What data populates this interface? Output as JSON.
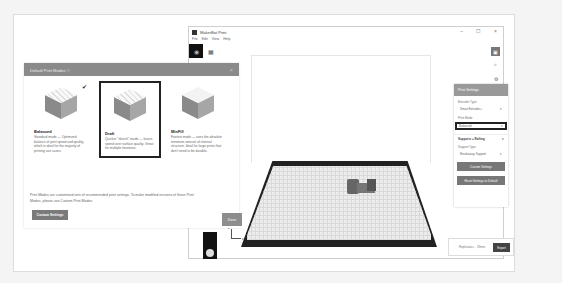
{
  "app": {
    "title": "MakerBot Print",
    "menu": [
      "File",
      "Edit",
      "View",
      "Help"
    ],
    "window_controls": [
      "–",
      "☐",
      "×"
    ]
  },
  "dialog": {
    "title": "Default Print Modes ⓘ",
    "close": "×",
    "modes": [
      {
        "name": "Balanced",
        "description": "Standard mode — Optimized balance of print speed and quality, which is ideal for the majority of printing use cases.",
        "checked": true,
        "selected": false
      },
      {
        "name": "Draft",
        "description": "Quicker \"sketch\" mode — favors speed over surface quality. Great for multiple iterations.",
        "checked": false,
        "selected": true
      },
      {
        "name": "MinFill",
        "description": "Fastest mode — uses the absolute minimum amount of internal structure. Ideal for large prints that don't need to be durable.",
        "checked": false,
        "selected": false
      }
    ],
    "footer_text": "Print Modes are customized sets of recommended print settings. To make modified versions of these Print Modes, please use Custom Print Modes.",
    "custom_settings_label": "Custom Settings",
    "done_label": "Done"
  },
  "print_settings": {
    "title": "Print Settings",
    "extruder_label": "Extruder Type",
    "extruder_value": "Smart Extruder+",
    "print_mode_label": "Print Mode",
    "print_mode_value": "Balanced",
    "supports_section": "Supports + Rafting",
    "support_type_label": "Support Type",
    "support_type_value": "Breakaway Support",
    "custom_settings_label": "Custom Settings",
    "reset_label": "Reset Settings to Default"
  },
  "export": {
    "file_label": "Replicator+ · 29min",
    "button_label": "Export"
  },
  "axis": {
    "z": "z",
    "x": "x"
  }
}
